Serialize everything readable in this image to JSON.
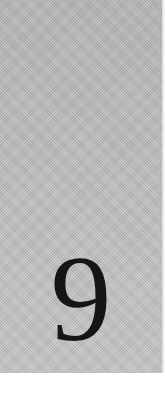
{
  "card": {
    "numeral": "9",
    "background_color": "#bdbdbd",
    "numeral_color": "#151515"
  }
}
